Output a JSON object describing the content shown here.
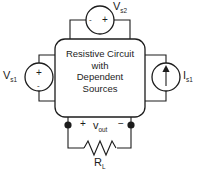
{
  "diagram": {
    "stroke_color": "#1c1c1c",
    "background_color": "#ffffff"
  },
  "block": {
    "line1": "Resistive Circuit",
    "line2": "with",
    "line3": "Dependent",
    "line4": "Sources"
  },
  "sources": {
    "top_voltage": {
      "symbol": "V",
      "subscript": "s2",
      "plus": "+",
      "minus": "-",
      "type": "voltage-source"
    },
    "left_voltage": {
      "symbol": "V",
      "subscript": "s1",
      "plus": "+",
      "minus": "-",
      "type": "voltage-source"
    },
    "right_current": {
      "symbol": "I",
      "subscript": "s1",
      "type": "current-source",
      "arrow_direction": "up"
    }
  },
  "output": {
    "plus": "+",
    "minus": "−",
    "symbol": "v",
    "subscript": "out"
  },
  "load": {
    "symbol": "R",
    "subscript": "L",
    "type": "resistor"
  }
}
